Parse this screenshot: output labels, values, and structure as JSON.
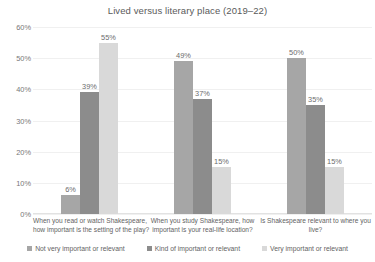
{
  "chart_data": {
    "type": "bar",
    "title": "Lived versus literary place (2019–22)",
    "xlabel": "",
    "ylabel": "",
    "ylim": [
      0,
      60
    ],
    "ytick_labels": [
      "0%",
      "10%",
      "20%",
      "30%",
      "40%",
      "50%",
      "60%"
    ],
    "ytick_values": [
      0,
      10,
      20,
      30,
      40,
      50,
      60
    ],
    "grid": true,
    "legend_position": "bottom",
    "categories": [
      {
        "lines": [
          "When you read or watch Shakespeare,",
          "how important is the setting of the play?"
        ]
      },
      {
        "lines": [
          "When you study Shakespeare, how",
          "important is your real-life location?"
        ]
      },
      {
        "lines": [
          "Is Shakespeare relevant to where you",
          "live?"
        ]
      }
    ],
    "series": [
      {
        "name": "Not very important or relevant",
        "color": "#a6a6a6",
        "values": [
          6,
          49,
          50
        ],
        "labels": [
          "6%",
          "49%",
          "50%"
        ]
      },
      {
        "name": "Kind of important or relevant",
        "color": "#8c8c8c",
        "values": [
          39,
          37,
          35
        ],
        "labels": [
          "39%",
          "37%",
          "35%"
        ]
      },
      {
        "name": "Very important or relevant",
        "color": "#d9d9d9",
        "values": [
          55,
          15,
          15
        ],
        "labels": [
          "55%",
          "15%",
          "15%"
        ]
      }
    ]
  }
}
